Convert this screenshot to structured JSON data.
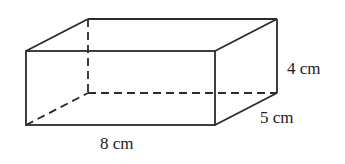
{
  "figure": {
    "shape": "rectangular-prism",
    "colors": {
      "line": "#2b2b2b",
      "text": "#222222",
      "background": "#ffffff"
    },
    "vertices": {
      "front_top_left": [
        26,
        51
      ],
      "front_top_right": [
        215,
        51
      ],
      "front_bottom_left": [
        26,
        125
      ],
      "front_bottom_right": [
        215,
        125
      ],
      "back_top_left": [
        88,
        19
      ],
      "back_top_right": [
        277,
        19
      ],
      "back_bottom_left": [
        88,
        93
      ],
      "back_bottom_right": [
        277,
        93
      ]
    },
    "labels": {
      "length": "8 cm",
      "width": "5 cm",
      "height": "4 cm"
    }
  }
}
